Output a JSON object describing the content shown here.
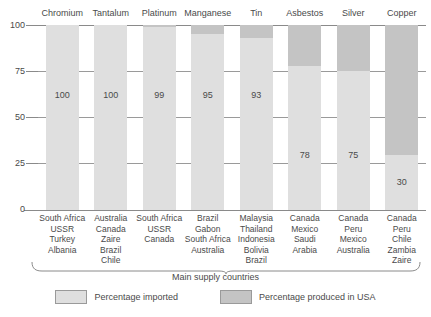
{
  "chart_data": {
    "type": "bar",
    "title": "",
    "subtitle": "",
    "xlabel": "Main supply countries",
    "ylabel": "",
    "ylim": [
      0,
      100
    ],
    "yticks": [
      0,
      25,
      50,
      75,
      100
    ],
    "ytick_labels": [
      "0",
      "25",
      "50",
      "75",
      "100"
    ],
    "grid": true,
    "legend_position": "bottom",
    "stacked": true,
    "categories": [
      "Chromium",
      "Tantalum",
      "Platinum",
      "Manganese",
      "Tin",
      "Asbestos",
      "Silver",
      "Copper"
    ],
    "series": [
      {
        "name": "Percentage imported",
        "color": "#dfdfdf",
        "values": [
          100,
          100,
          99,
          95,
          93,
          78,
          75,
          30
        ]
      },
      {
        "name": "Percentage produced in USA",
        "color": "#c4c4c4",
        "values": [
          0,
          0,
          1,
          5,
          7,
          22,
          25,
          70
        ]
      }
    ],
    "data_labels": [
      "100",
      "100",
      "99",
      "95",
      "93",
      "78",
      "75",
      "30"
    ],
    "supply_countries": [
      [
        "South Africa",
        "USSR",
        "Turkey",
        "Albania"
      ],
      [
        "Australia",
        "Canada",
        "Zaire",
        "Brazil",
        "Chile"
      ],
      [
        "South Africa",
        "USSR",
        "Canada"
      ],
      [
        "Brazil",
        "Gabon",
        "South Africa",
        "Australia"
      ],
      [
        "Malaysia",
        "Thailand",
        "Indonesia",
        "Bolivia",
        "Brazil"
      ],
      [
        "Canada",
        "Mexico",
        "Saudi",
        "Arabia"
      ],
      [
        "Canada",
        "Peru",
        "Mexico",
        "Australia"
      ],
      [
        "Canada",
        "Peru",
        "Chile",
        "Zambia",
        "Zaire"
      ]
    ]
  },
  "legend": {
    "items": [
      {
        "label": "Percentage imported",
        "color": "#dfdfdf"
      },
      {
        "label": "Percentage produced in USA",
        "color": "#c4c4c4"
      }
    ]
  }
}
